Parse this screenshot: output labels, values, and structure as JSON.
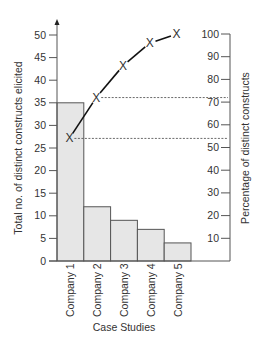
{
  "chart_data": {
    "type": "bar",
    "title": "",
    "xlabel": "Case Studies",
    "ylabel": "Total no. of distinct constructs elicited",
    "y2label": "Percentage of distinct constructs",
    "categories": [
      "Company 1",
      "Company 2",
      "Company 3",
      "Company 4",
      "Company 5"
    ],
    "series": [
      {
        "name": "Total no. of distinct constructs elicited",
        "type": "bar",
        "axis": "left",
        "values": [
          35,
          12,
          9,
          7,
          4
        ]
      },
      {
        "name": "Percentage of distinct constructs",
        "type": "line",
        "axis": "right",
        "marker": "x",
        "values": [
          54,
          72,
          86,
          96,
          100
        ]
      }
    ],
    "ylim": [
      0,
      50
    ],
    "yticks": [
      0,
      5,
      10,
      15,
      20,
      25,
      30,
      35,
      40,
      45,
      50
    ],
    "y2lim": [
      0,
      100
    ],
    "y2ticks": [
      10,
      20,
      30,
      40,
      50,
      60,
      70,
      80,
      90,
      100
    ],
    "reference_lines": [
      {
        "series_point": 0,
        "style": "dashed",
        "to": "right-axis"
      },
      {
        "series_point": 1,
        "style": "dashed",
        "to": "right-axis"
      }
    ],
    "grid": false,
    "legend": "none"
  },
  "colors": {
    "bar_fill": "#e6e6e6",
    "bar_stroke": "#555555",
    "axis": "#555555",
    "line": "#111111",
    "text": "#333333"
  }
}
